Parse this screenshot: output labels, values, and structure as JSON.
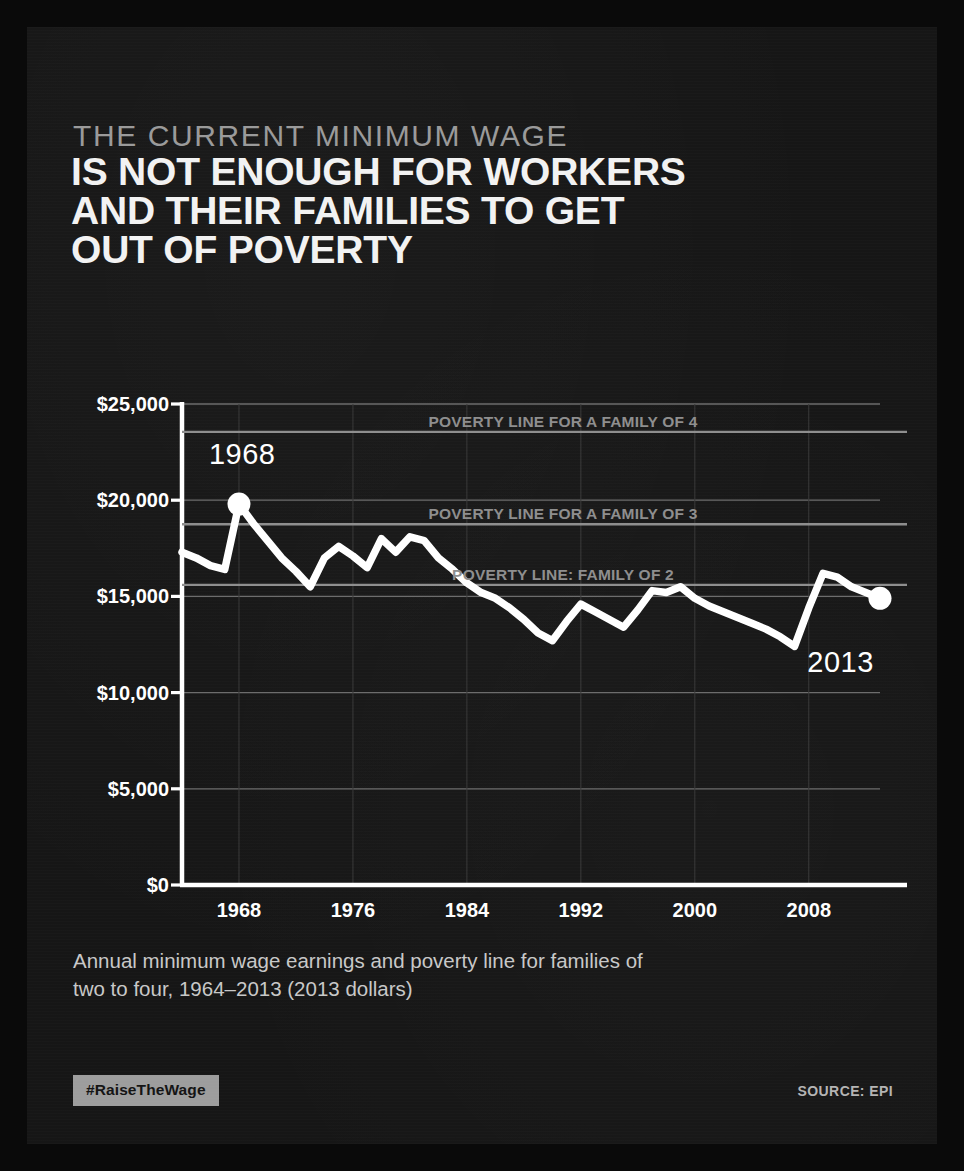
{
  "poster": {
    "background_color": "#161616",
    "kicker": "THE CURRENT MINIMUM WAGE",
    "headline_lines": [
      "IS NOT ENOUGH FOR WORKERS",
      "AND THEIR FAMILIES TO GET",
      "OUT OF POVERTY"
    ],
    "caption_lines": [
      "Annual minimum wage earnings and poverty line for families of",
      "two to four, 1964–2013 (2013 dollars)"
    ],
    "hashtag": "#RaiseTheWage",
    "source": "SOURCE: EPI",
    "accent_color": "#9d9d9d",
    "line_color": "#ffffff",
    "reference_line_color": "#8e8e8e"
  },
  "chart_data": {
    "type": "line",
    "xlabel": "",
    "ylabel": "",
    "xlim": [
      1964,
      2013
    ],
    "ylim": [
      0,
      25000
    ],
    "grid": true,
    "legend_position": "inline-annotations",
    "y_ticks": [
      0,
      5000,
      10000,
      15000,
      20000,
      25000
    ],
    "y_tick_labels": [
      "$0",
      "$5,000",
      "$10,000",
      "$15,000",
      "$20,000",
      "$25,000"
    ],
    "x_ticks": [
      1968,
      1976,
      1984,
      1992,
      2000,
      2008
    ],
    "x_tick_labels": [
      "1968",
      "1976",
      "1984",
      "1992",
      "2000",
      "2008"
    ],
    "series": [
      {
        "name": "Annual minimum wage earnings",
        "color": "#ffffff",
        "x": [
          1964,
          1965,
          1966,
          1967,
          1968,
          1969,
          1970,
          1971,
          1972,
          1973,
          1974,
          1975,
          1976,
          1977,
          1978,
          1979,
          1980,
          1981,
          1982,
          1983,
          1984,
          1985,
          1986,
          1987,
          1988,
          1989,
          1990,
          1991,
          1992,
          1993,
          1994,
          1995,
          1996,
          1997,
          1998,
          1999,
          2000,
          2001,
          2002,
          2003,
          2004,
          2005,
          2006,
          2007,
          2008,
          2009,
          2010,
          2011,
          2012,
          2013
        ],
        "values": [
          17300,
          17000,
          16600,
          16400,
          19800,
          18800,
          17900,
          17000,
          16300,
          15500,
          17000,
          17600,
          17100,
          16500,
          18000,
          17300,
          18100,
          17900,
          17000,
          16400,
          15700,
          15200,
          14900,
          14400,
          13800,
          13100,
          12700,
          13700,
          14600,
          14200,
          13800,
          13400,
          14300,
          15300,
          15200,
          15500,
          14900,
          14500,
          14200,
          13900,
          13600,
          13300,
          12900,
          12400,
          14400,
          16200,
          16000,
          15500,
          15200,
          14900
        ],
        "markers": [
          {
            "x": 1968,
            "y": 19800,
            "label": "1968"
          },
          {
            "x": 2013,
            "y": 14900,
            "label": "2013"
          }
        ]
      }
    ],
    "reference_lines": [
      {
        "label": "POVERTY LINE FOR A FAMILY OF 4",
        "value": 23550,
        "color": "#8e8e8e"
      },
      {
        "label": "POVERTY LINE FOR A FAMILY OF 3",
        "value": 18750,
        "color": "#8e8e8e"
      },
      {
        "label": "POVERTY LINE: FAMILY OF 2",
        "value": 15600,
        "color": "#8e8e8e"
      }
    ],
    "annotations": [
      {
        "text": "1968",
        "x": 1968,
        "y": 22200
      },
      {
        "text": "2013",
        "x": 2010,
        "y": 11400
      }
    ]
  }
}
